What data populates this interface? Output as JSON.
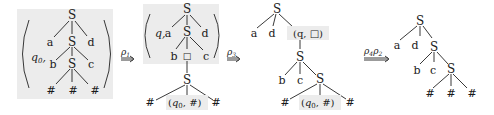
{
  "diagram": {
    "colors": {
      "shade": "#ececec",
      "ink": "#1a1a1a",
      "background": "#ffffff"
    },
    "arrows": [
      {
        "id": "arrow1",
        "label": "ρ",
        "sub": "1"
      },
      {
        "id": "arrow2",
        "label": "ρ",
        "sub": "3"
      },
      {
        "id": "arrow3",
        "label": "ρ",
        "sub": "4",
        "label2": "ρ",
        "sub2": "2"
      }
    ],
    "trees": [
      {
        "id": "tree1",
        "state": {
          "q": "q",
          "q_sub": "0",
          "comma": ","
        },
        "nodes": {
          "root": "S",
          "a": "a",
          "mid": "S",
          "d": "d",
          "b": "b",
          "low": "S",
          "c": "c",
          "h1": "#",
          "h2": "#",
          "h3": "#"
        }
      },
      {
        "id": "tree2",
        "state": {
          "q": "q",
          "comma": ","
        },
        "nodes": {
          "root": "S",
          "a": "a",
          "mid": "S",
          "d": "d",
          "b": "b",
          "box": "□",
          "c": "c",
          "low": "S",
          "h1": "#",
          "h3": "#"
        },
        "leaf_state": {
          "open": "(",
          "q": "q",
          "q_sub": "0",
          "rest": ", #)"
        }
      },
      {
        "id": "tree3",
        "nodes": {
          "root": "S",
          "a": "a",
          "d": "d",
          "mid": "S",
          "b": "b",
          "c": "c",
          "low": "S",
          "h1": "#",
          "h3": "#"
        },
        "state_node": {
          "text": "(q, □)"
        },
        "leaf_state": {
          "open": "(",
          "q": "q",
          "q_sub": "0",
          "rest": ", #)"
        }
      },
      {
        "id": "tree4",
        "nodes": {
          "root": "S",
          "a": "a",
          "d": "d",
          "mid": "S",
          "b": "b",
          "c": "c",
          "low": "S",
          "h1": "#",
          "h2": "#",
          "h3": "#"
        }
      }
    ]
  }
}
